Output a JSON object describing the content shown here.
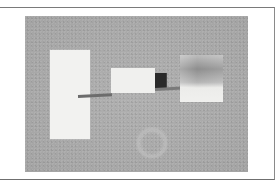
{
  "figure": {
    "caption_fragment": "",
    "photo": {
      "description": "Optical bench setup photograph on gray speckled surface",
      "objects": [
        {
          "name": "left-screen-card",
          "color": "#f2f2f0"
        },
        {
          "name": "rod-left",
          "color": "#6c6c6c"
        },
        {
          "name": "middle-block",
          "color": "#f0f0ee"
        },
        {
          "name": "dark-cube",
          "color": "#2a2a2a"
        },
        {
          "name": "rod-right",
          "color": "#7a7a7a"
        },
        {
          "name": "right-shaded-card",
          "color": "#8e8e8e"
        },
        {
          "name": "transparent-ring",
          "color": "#bdbdbd"
        }
      ],
      "background_color": "#a9a9a9"
    },
    "frame_color": "#7a7a7a"
  }
}
